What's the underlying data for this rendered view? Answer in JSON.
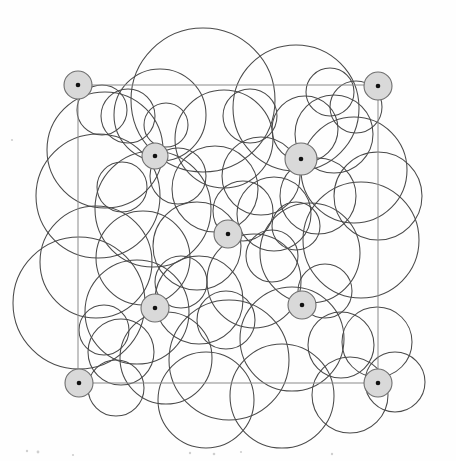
{
  "figure": {
    "type": "geometric-diagram",
    "canvas": {
      "width": 456,
      "height": 461,
      "background": "#fefefe"
    },
    "style": {
      "circle_stroke_color": "#4a4a4a",
      "circle_stroke_width": 1.05,
      "frame_stroke_color": "#8a8a8a",
      "frame_stroke_width": 1,
      "marker_fill_color": "#d9d9d9",
      "marker_stroke_color": "#6e6e6e",
      "marker_dot_color": "#111111"
    },
    "frame": {
      "label": "square-cell-boundary",
      "x": 78,
      "y": 85,
      "width": 300,
      "height": 298
    },
    "corner_markers": [
      {
        "label": "corner-top-left",
        "cx": 78,
        "cy": 85,
        "r": 14
      },
      {
        "label": "corner-top-right",
        "cx": 378,
        "cy": 86,
        "r": 14
      },
      {
        "label": "corner-bottom-left",
        "cx": 79,
        "cy": 383,
        "r": 14
      },
      {
        "label": "corner-bottom-right",
        "cx": 378,
        "cy": 383,
        "r": 14
      }
    ],
    "interior_markers": [
      {
        "label": "interior-upper-left",
        "cx": 155,
        "cy": 156,
        "r": 13
      },
      {
        "label": "interior-upper-right",
        "cx": 301,
        "cy": 159,
        "r": 16
      },
      {
        "label": "interior-center",
        "cx": 228,
        "cy": 234,
        "r": 14
      },
      {
        "label": "interior-lower-left",
        "cx": 155,
        "cy": 308,
        "r": 14
      },
      {
        "label": "interior-lower-right",
        "cx": 302,
        "cy": 305,
        "r": 14
      }
    ],
    "marker_dot_radius": 2.3,
    "circles": [
      {
        "cx": 203,
        "cy": 100,
        "r": 72
      },
      {
        "cx": 296,
        "cy": 108,
        "r": 63
      },
      {
        "cx": 224,
        "cy": 139,
        "r": 49
      },
      {
        "cx": 160,
        "cy": 115,
        "r": 46
      },
      {
        "cx": 128,
        "cy": 116,
        "r": 27
      },
      {
        "cx": 102,
        "cy": 110,
        "r": 25
      },
      {
        "cx": 105,
        "cy": 150,
        "r": 58
      },
      {
        "cx": 98,
        "cy": 196,
        "r": 62
      },
      {
        "cx": 153,
        "cy": 209,
        "r": 58
      },
      {
        "cx": 215,
        "cy": 189,
        "r": 43
      },
      {
        "cx": 261,
        "cy": 176,
        "r": 39
      },
      {
        "cx": 305,
        "cy": 129,
        "r": 33
      },
      {
        "cx": 334,
        "cy": 134,
        "r": 39
      },
      {
        "cx": 354,
        "cy": 170,
        "r": 53
      },
      {
        "cx": 318,
        "cy": 196,
        "r": 38
      },
      {
        "cx": 274,
        "cy": 214,
        "r": 37
      },
      {
        "cx": 197,
        "cy": 246,
        "r": 44
      },
      {
        "cx": 143,
        "cy": 258,
        "r": 47
      },
      {
        "cx": 96,
        "cy": 262,
        "r": 56
      },
      {
        "cx": 79,
        "cy": 303,
        "r": 66
      },
      {
        "cx": 137,
        "cy": 312,
        "r": 52
      },
      {
        "cx": 199,
        "cy": 300,
        "r": 44
      },
      {
        "cx": 254,
        "cy": 281,
        "r": 47
      },
      {
        "cx": 310,
        "cy": 253,
        "r": 50
      },
      {
        "cx": 361,
        "cy": 240,
        "r": 58
      },
      {
        "cx": 378,
        "cy": 196,
        "r": 44
      },
      {
        "cx": 292,
        "cy": 339,
        "r": 52
      },
      {
        "cx": 229,
        "cy": 360,
        "r": 60
      },
      {
        "cx": 166,
        "cy": 358,
        "r": 46
      },
      {
        "cx": 121,
        "cy": 352,
        "r": 33
      },
      {
        "cx": 116,
        "cy": 388,
        "r": 28
      },
      {
        "cx": 341,
        "cy": 345,
        "r": 33
      },
      {
        "cx": 377,
        "cy": 342,
        "r": 35
      },
      {
        "cx": 395,
        "cy": 382,
        "r": 30
      },
      {
        "cx": 350,
        "cy": 395,
        "r": 38
      },
      {
        "cx": 282,
        "cy": 396,
        "r": 52
      },
      {
        "cx": 206,
        "cy": 400,
        "r": 48
      },
      {
        "cx": 243,
        "cy": 211,
        "r": 30
      },
      {
        "cx": 178,
        "cy": 176,
        "r": 28
      },
      {
        "cx": 122,
        "cy": 187,
        "r": 25
      },
      {
        "cx": 250,
        "cy": 116,
        "r": 27
      },
      {
        "cx": 330,
        "cy": 92,
        "r": 24
      },
      {
        "cx": 356,
        "cy": 107,
        "r": 26
      },
      {
        "cx": 272,
        "cy": 256,
        "r": 26
      },
      {
        "cx": 181,
        "cy": 282,
        "r": 26
      },
      {
        "cx": 226,
        "cy": 320,
        "r": 29
      },
      {
        "cx": 325,
        "cy": 291,
        "r": 27
      },
      {
        "cx": 104,
        "cy": 330,
        "r": 25
      },
      {
        "cx": 166,
        "cy": 125,
        "r": 22
      },
      {
        "cx": 296,
        "cy": 226,
        "r": 24
      }
    ],
    "scan_specks": [
      {
        "cx": 27,
        "cy": 451,
        "r": 1.2
      },
      {
        "cx": 38,
        "cy": 452,
        "r": 1.4
      },
      {
        "cx": 73,
        "cy": 455,
        "r": 1.1
      },
      {
        "cx": 190,
        "cy": 453,
        "r": 1.2
      },
      {
        "cx": 214,
        "cy": 454,
        "r": 1.3
      },
      {
        "cx": 241,
        "cy": 452,
        "r": 1.1
      },
      {
        "cx": 332,
        "cy": 454,
        "r": 1.2
      },
      {
        "cx": 12,
        "cy": 140,
        "r": 1.1
      }
    ]
  }
}
